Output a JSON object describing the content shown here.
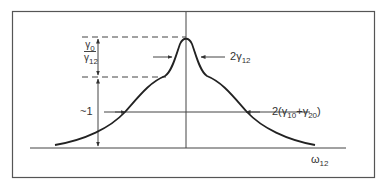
{
  "diagram": {
    "type": "lineshape-diagram",
    "x_axis_label": {
      "symbol": "ω",
      "subscript": "12"
    },
    "annotations": {
      "peak_height": {
        "numerator_symbol": "γ",
        "numerator_sub": "0",
        "denominator_symbol": "γ",
        "denominator_sub": "12"
      },
      "base_height": {
        "text": "~1"
      },
      "narrow_width": {
        "prefix": "2",
        "symbol": "γ",
        "subscript": "12"
      },
      "broad_width": {
        "prefix": "2(",
        "sym1": "γ",
        "sub1": "10",
        "plus": "+",
        "sym2": "γ",
        "sub2": "20",
        "suffix": ")"
      }
    },
    "colors": {
      "line": "#222222",
      "frame": "#444444",
      "background": "#ffffff"
    }
  }
}
